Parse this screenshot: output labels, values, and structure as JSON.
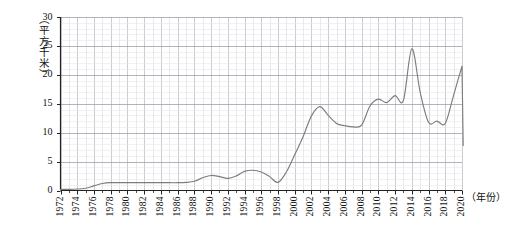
{
  "chart_data": {
    "type": "line",
    "title": "",
    "xlabel": "（年份）",
    "ylabel": "（平方千米）",
    "xlim": [
      1972,
      2020
    ],
    "ylim": [
      0,
      30
    ],
    "yticks": [
      0,
      5,
      10,
      15,
      20,
      25,
      30
    ],
    "xticks": [
      1972,
      1974,
      1976,
      1978,
      1980,
      1982,
      1984,
      1986,
      1988,
      1990,
      1992,
      1994,
      1996,
      1998,
      2000,
      2002,
      2004,
      2006,
      2008,
      2010,
      2012,
      2014,
      2016,
      2018,
      2020
    ],
    "grid": true,
    "grid_minor": true,
    "legend": "none",
    "line_color": "#7d7d7d",
    "grid_color": "#cfcfd6",
    "axis_color": "#222222",
    "x": [
      1972,
      1973,
      1974,
      1975,
      1976,
      1977,
      1978,
      1979,
      1980,
      1981,
      1982,
      1983,
      1984,
      1985,
      1986,
      1987,
      1988,
      1989,
      1990,
      1991,
      1992,
      1993,
      1994,
      1995,
      1996,
      1997,
      1998,
      1999,
      2000,
      2001,
      2002,
      2003,
      2004,
      2005,
      2006,
      2007,
      2008,
      2009,
      2010,
      2011,
      2012,
      2013,
      2014,
      2015,
      2016,
      2017,
      2018,
      2019,
      2020
    ],
    "values": [
      0.2,
      0.2,
      0.25,
      0.4,
      0.8,
      1.2,
      1.35,
      1.35,
      1.35,
      1.35,
      1.35,
      1.35,
      1.35,
      1.35,
      1.35,
      1.4,
      1.6,
      2.2,
      2.6,
      2.4,
      2.1,
      2.5,
      3.3,
      3.5,
      3.2,
      2.4,
      1.4,
      3.2,
      6.2,
      9.3,
      12.9,
      14.5,
      13.0,
      11.6,
      11.2,
      11.0,
      11.3,
      14.6,
      15.8,
      15.2,
      16.4,
      15.6,
      24.5,
      17.0,
      11.8,
      12.0,
      11.6,
      16.5,
      21.5
    ],
    "end_drop_value": 7.8,
    "series_name": "面积",
    "units": "平方千米"
  },
  "axis": {
    "y_label_text": "（平方千米）",
    "x_label_text": "（年份）"
  }
}
